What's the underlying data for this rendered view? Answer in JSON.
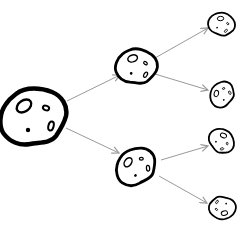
{
  "diagram": {
    "type": "tree",
    "colors": {
      "outline": "#000000",
      "arrow": "#999999",
      "background": "#ffffff"
    },
    "nodes": [
      {
        "id": "root",
        "icon": "asteroid-icon",
        "level": 0,
        "cx": 34,
        "cy": 116,
        "scale": 1.0
      },
      {
        "id": "mid-top",
        "icon": "asteroid-icon",
        "level": 1,
        "cx": 137,
        "cy": 66,
        "scale": 0.62
      },
      {
        "id": "mid-bottom",
        "icon": "asteroid-icon",
        "level": 1,
        "cx": 136,
        "cy": 166,
        "scale": 0.62
      },
      {
        "id": "leaf-1",
        "icon": "asteroid-icon",
        "level": 2,
        "cx": 222,
        "cy": 24,
        "scale": 0.4
      },
      {
        "id": "leaf-2",
        "icon": "asteroid-icon",
        "level": 2,
        "cx": 222,
        "cy": 94,
        "scale": 0.4
      },
      {
        "id": "leaf-3",
        "icon": "asteroid-icon",
        "level": 2,
        "cx": 222,
        "cy": 141,
        "scale": 0.4
      },
      {
        "id": "leaf-4",
        "icon": "asteroid-icon",
        "level": 2,
        "cx": 222,
        "cy": 208,
        "scale": 0.4
      }
    ],
    "edges": [
      {
        "from": "root",
        "to": "mid-top",
        "x1": 67,
        "y1": 101,
        "x2": 120,
        "y2": 75
      },
      {
        "from": "root",
        "to": "mid-bottom",
        "x1": 66,
        "y1": 128,
        "x2": 119,
        "y2": 153
      },
      {
        "from": "mid-top",
        "to": "leaf-1",
        "x1": 155,
        "y1": 58,
        "x2": 208,
        "y2": 28
      },
      {
        "from": "mid-top",
        "to": "leaf-2",
        "x1": 155,
        "y1": 74,
        "x2": 208,
        "y2": 90
      },
      {
        "from": "mid-bottom",
        "to": "leaf-3",
        "x1": 161,
        "y1": 160,
        "x2": 208,
        "y2": 146
      },
      {
        "from": "mid-bottom",
        "to": "leaf-4",
        "x1": 159,
        "y1": 176,
        "x2": 207,
        "y2": 203
      }
    ]
  }
}
